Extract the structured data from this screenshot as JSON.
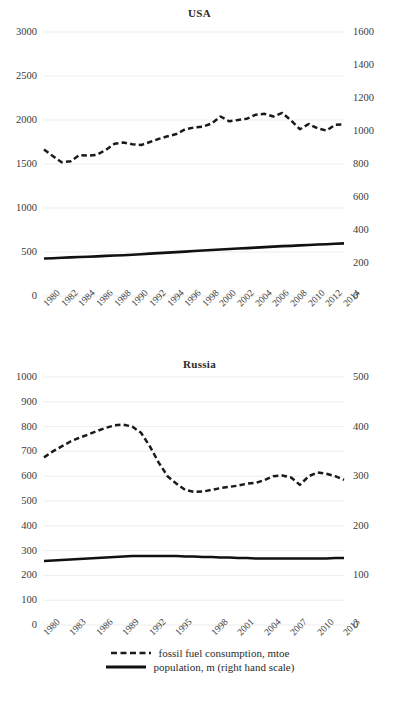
{
  "figure": {
    "background": "#ffffff",
    "series_colors": {
      "fossil": "#1a1a1a",
      "population": "#111111"
    }
  },
  "legend": {
    "position": "bottom-center",
    "items": [
      {
        "label": "fossil fuel consumption, mtoe",
        "style": "dashed",
        "icon": "dashed-line-icon"
      },
      {
        "label": "population, m (right hand scale)",
        "style": "solid",
        "icon": "solid-line-icon"
      }
    ]
  },
  "chart_data": [
    {
      "type": "line",
      "title": "USA",
      "xlabel": "",
      "ylabel": "",
      "grid": true,
      "legend": "bottom",
      "x": [
        1980,
        1981,
        1982,
        1983,
        1984,
        1985,
        1986,
        1987,
        1988,
        1989,
        1990,
        1991,
        1992,
        1993,
        1994,
        1995,
        1996,
        1997,
        1998,
        1999,
        2000,
        2001,
        2002,
        2003,
        2004,
        2005,
        2006,
        2007,
        2008,
        2009,
        2010,
        2011,
        2012,
        2013,
        2014
      ],
      "xticklabels": [
        "1980",
        "1982",
        "1984",
        "1986",
        "1988",
        "1990",
        "1992",
        "1994",
        "1996",
        "1998",
        "2000",
        "2002",
        "2004",
        "2006",
        "2008",
        "2010",
        "2012",
        "2014"
      ],
      "ylim": [
        0,
        3000
      ],
      "yticks": [
        0,
        500,
        1000,
        1500,
        2000,
        2500,
        3000
      ],
      "ylim_right": [
        0,
        1600
      ],
      "yticks_right": [
        0,
        200,
        400,
        600,
        800,
        1000,
        1200,
        1400,
        1600
      ],
      "series": [
        {
          "name": "fossil fuel consumption, mtoe",
          "axis": "left",
          "style": "dashed",
          "values": [
            1665,
            1590,
            1520,
            1530,
            1600,
            1595,
            1605,
            1660,
            1730,
            1745,
            1725,
            1715,
            1750,
            1785,
            1815,
            1840,
            1895,
            1915,
            1925,
            1960,
            2040,
            1985,
            2000,
            2015,
            2060,
            2070,
            2040,
            2080,
            1995,
            1895,
            1955,
            1905,
            1880,
            1945,
            1950
          ]
        },
        {
          "name": "population, m (right hand scale)",
          "axis": "right",
          "style": "solid",
          "values": [
            227,
            229,
            232,
            234,
            236,
            238,
            240,
            243,
            245,
            247,
            250,
            253,
            257,
            260,
            263,
            266,
            269,
            273,
            276,
            279,
            282,
            285,
            288,
            290,
            293,
            296,
            299,
            302,
            304,
            307,
            309,
            312,
            314,
            317,
            319
          ]
        }
      ]
    },
    {
      "type": "line",
      "title": "Russia",
      "xlabel": "",
      "ylabel": "",
      "grid": true,
      "legend": "bottom",
      "x": [
        1980,
        1981,
        1982,
        1983,
        1984,
        1985,
        1986,
        1987,
        1988,
        1989,
        1990,
        1991,
        1992,
        1993,
        1994,
        1995,
        1996,
        1997,
        1998,
        1999,
        2000,
        2001,
        2002,
        2003,
        2004,
        2005,
        2006,
        2007,
        2008,
        2009,
        2010,
        2011,
        2012,
        2013,
        2014
      ],
      "xticklabels": [
        "1980",
        "1983",
        "1986",
        "1989",
        "1992",
        "1995",
        "1998",
        "2001",
        "2004",
        "2007",
        "2010",
        "2013"
      ],
      "ylim": [
        0,
        1000
      ],
      "yticks": [
        0,
        100,
        200,
        300,
        400,
        500,
        600,
        700,
        800,
        900,
        1000
      ],
      "ylim_right": [
        0,
        500
      ],
      "yticks_right": [
        0,
        100,
        200,
        300,
        400,
        500
      ],
      "series": [
        {
          "name": "fossil fuel consumption, mtoe",
          "axis": "left",
          "style": "dashed",
          "values": [
            676,
            700,
            720,
            740,
            755,
            768,
            782,
            795,
            805,
            808,
            800,
            775,
            720,
            655,
            600,
            570,
            545,
            537,
            538,
            545,
            552,
            557,
            562,
            570,
            573,
            585,
            600,
            603,
            595,
            565,
            600,
            615,
            610,
            600,
            585
          ]
        },
        {
          "name": "population, m (right hand scale)",
          "axis": "right",
          "style": "solid",
          "values": [
            129,
            130,
            131,
            132,
            133,
            134,
            135,
            136,
            137,
            138,
            139,
            139,
            139,
            139,
            139,
            139,
            138,
            138,
            137,
            137,
            136,
            136,
            135,
            135,
            134,
            134,
            134,
            134,
            134,
            134,
            134,
            134,
            134,
            135,
            135
          ]
        }
      ]
    }
  ]
}
